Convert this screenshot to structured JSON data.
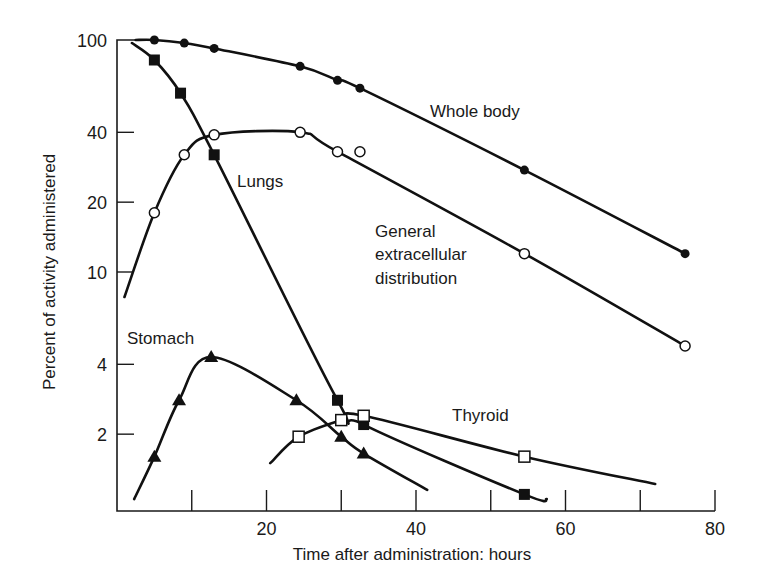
{
  "chart_data": {
    "type": "line",
    "title": "",
    "xlabel": "Time after administration: hours",
    "ylabel": "Percent of activity administered",
    "xlim": [
      0,
      80
    ],
    "ylim": [
      0.95,
      100
    ],
    "yscale": "log",
    "grid": false,
    "legend": "inline labels next to curves",
    "x_ticks": [
      10,
      20,
      30,
      40,
      50,
      60,
      70,
      80
    ],
    "x_tick_labels": [
      "20",
      "40",
      "60",
      "80"
    ],
    "y_ticks": [
      2,
      4,
      10,
      20,
      40,
      100
    ],
    "y_tick_labels": [
      "2",
      "4",
      "10",
      "20",
      "40",
      "100"
    ],
    "series": [
      {
        "name": "Whole body",
        "marker": "filled-circle",
        "x": [
          5,
          9,
          13,
          24.5,
          29.5,
          32.5,
          54.5,
          76
        ],
        "values": [
          100,
          97,
          92,
          77,
          67,
          62,
          27.5,
          12
        ]
      },
      {
        "name": "General extracellular distribution",
        "marker": "open-circle",
        "x": [
          5,
          9,
          13,
          24.5,
          29.5,
          32.5,
          54.5,
          76
        ],
        "values": [
          18,
          32,
          39,
          40,
          33,
          33,
          12,
          4.8
        ]
      },
      {
        "name": "Lungs",
        "marker": "filled-square",
        "x": [
          5,
          8.5,
          13,
          29.5,
          33,
          54.5
        ],
        "values": [
          82,
          59,
          32,
          2.8,
          2.2,
          1.1
        ]
      },
      {
        "name": "Stomach",
        "marker": "filled-triangle",
        "x": [
          5,
          8.3,
          12.6,
          24,
          30,
          33
        ],
        "values": [
          1.6,
          2.8,
          4.3,
          2.8,
          1.95,
          1.65
        ]
      },
      {
        "name": "Thyroid",
        "marker": "open-square",
        "x": [
          24.3,
          30,
          33,
          54.5
        ],
        "values": [
          1.95,
          2.3,
          2.4,
          1.6
        ]
      }
    ],
    "annotations": [
      "Whole body",
      "Lungs",
      "General extracellular distribution",
      "Stomach",
      "Thyroid"
    ]
  },
  "labels": {
    "whole_body": "Whole body",
    "lungs": "Lungs",
    "general_1": "General",
    "general_2": "extracellular",
    "general_3": "distribution",
    "stomach": "Stomach",
    "thyroid": "Thyroid"
  }
}
